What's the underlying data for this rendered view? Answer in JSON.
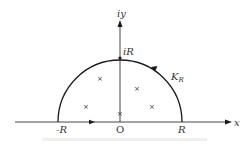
{
  "diagram": {
    "type": "semicircular contour in the complex plane",
    "axes": {
      "x_label": "x",
      "y_label": "iy",
      "origin_label": "O"
    },
    "points": {
      "left": "-R",
      "right": "R",
      "top": "iR"
    },
    "contour": {
      "label_main": "K",
      "label_sub": "R",
      "orientation": "counterclockwise"
    },
    "singularities": [
      {
        "marker": "×",
        "x": 100,
        "y": 78
      },
      {
        "marker": "×",
        "x": 86,
        "y": 106
      },
      {
        "marker": "×",
        "x": 137,
        "y": 88
      },
      {
        "marker": "×",
        "x": 152,
        "y": 106
      },
      {
        "marker": "×",
        "x": 120,
        "y": 113
      }
    ],
    "colors": {
      "stroke": "#1a1a1a",
      "text": "#333333",
      "background": "#ffffff"
    }
  }
}
